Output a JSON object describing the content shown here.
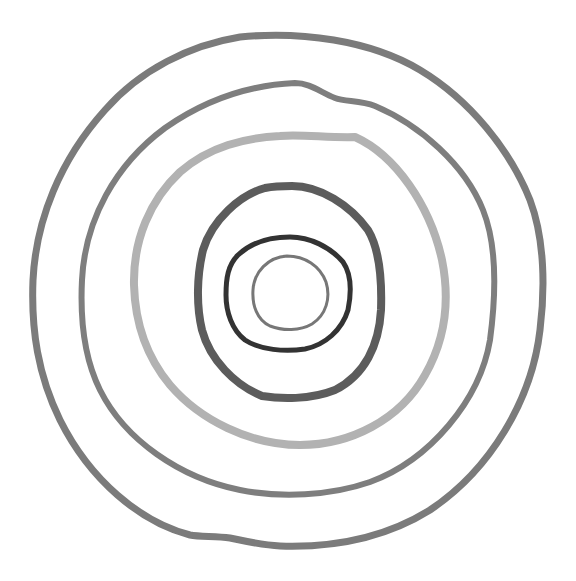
{
  "figure": {
    "background": "#ffffff",
    "rings": [
      {
        "name": "ring-1-outer",
        "color": "#7b7b7b",
        "stroke_width": 7
      },
      {
        "name": "ring-2",
        "color": "#7e7e7e",
        "stroke_width": 6
      },
      {
        "name": "ring-3-light",
        "color": "#b2b2b2",
        "stroke_width": 8
      },
      {
        "name": "ring-4",
        "color": "#5c5c5c",
        "stroke_width": 8
      },
      {
        "name": "ring-5-dark",
        "color": "#333333",
        "stroke_width": 5
      },
      {
        "name": "ring-6-inner",
        "color": "#777777",
        "stroke_width": 3
      }
    ]
  }
}
